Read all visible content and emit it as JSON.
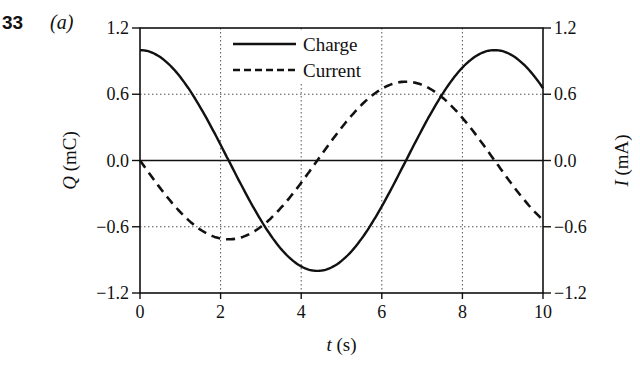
{
  "header": {
    "problem_number": "33",
    "part_label": "(a)"
  },
  "chart_data": {
    "type": "line",
    "title": "",
    "xlabel": "t (s)",
    "xlabel_var": "t",
    "xlabel_unit": " (s)",
    "ylabel_left": "Q (mC)",
    "ylabel_left_var": "Q",
    "ylabel_left_unit": " (mC)",
    "ylabel_right": "I (mA)",
    "ylabel_right_var": "I",
    "ylabel_right_unit": " (mA)",
    "xlim": [
      0,
      10
    ],
    "ylim_left": [
      -1.2,
      1.2
    ],
    "ylim_right": [
      -1.2,
      1.2
    ],
    "x_ticks": [
      "0",
      "2",
      "4",
      "6",
      "8",
      "10"
    ],
    "y_ticks_left": [
      "1.2",
      "0.6",
      "0.0",
      "−0.6",
      "−1.2"
    ],
    "y_ticks_right": [
      "1.2",
      "0.6",
      "0.0",
      "−0.6",
      "−1.2"
    ],
    "grid": "dotted",
    "legend_position": "upper-center",
    "series": [
      {
        "name": "Charge",
        "style": "solid",
        "axis": "left",
        "x": [
          0,
          0.5,
          1,
          1.5,
          2,
          2.5,
          3,
          3.5,
          4,
          4.5,
          5,
          5.5,
          6,
          6.5,
          7,
          7.5,
          8,
          8.5,
          9,
          9.5,
          10
        ],
        "values": [
          1.0,
          0.94,
          0.75,
          0.47,
          0.14,
          -0.21,
          -0.53,
          -0.79,
          -0.96,
          -1.0,
          -0.91,
          -0.71,
          -0.42,
          -0.08,
          0.27,
          0.58,
          0.83,
          0.98,
          0.99,
          0.88,
          0.64
        ]
      },
      {
        "name": "Current",
        "style": "dashed",
        "axis": "right",
        "x": [
          0,
          0.5,
          1,
          1.5,
          2,
          2.5,
          3,
          3.5,
          4,
          4.5,
          5,
          5.5,
          6,
          6.5,
          7,
          7.5,
          8,
          8.5,
          9,
          9.5,
          10
        ],
        "values": [
          0.0,
          -0.25,
          -0.47,
          -0.63,
          -0.71,
          -0.7,
          -0.6,
          -0.44,
          -0.21,
          0.03,
          0.28,
          0.5,
          0.65,
          0.71,
          0.69,
          0.58,
          0.39,
          0.15,
          -0.1,
          -0.34,
          -0.54
        ]
      }
    ]
  }
}
